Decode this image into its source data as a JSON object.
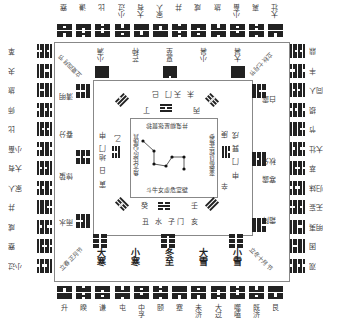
{
  "diagram": {
    "orientation": "rotated 180 degrees",
    "top_row_labels": [
      "蹇",
      "谦",
      "比",
      "小过",
      "大有",
      "家人",
      "井",
      "咸",
      "旅",
      "小畜",
      "离",
      "大壮"
    ],
    "bottom_row_labels": [
      "升",
      "睽",
      "谦",
      "屯",
      "中孚",
      "颐",
      "蹇",
      "未济",
      "大过",
      "噬嗑",
      "既济",
      "艮"
    ],
    "left_col_labels": [
      "革",
      "夬",
      "旅",
      "师",
      "比",
      "小畜",
      "大有",
      "家人",
      "井",
      "咸",
      "蹇",
      "小过"
    ],
    "right_col_labels": [
      "鼎",
      "丰",
      "同人",
      "损",
      "节",
      "大壮",
      "萃",
      "归妹",
      "无妄",
      "明夷",
      "困",
      "观"
    ],
    "solar_terms": {
      "bottom": [
        "大寒",
        "小寒",
        "冬至",
        "大雪",
        "小雪"
      ],
      "top": [
        "小满",
        "芒种",
        "夏至",
        "小暑",
        "大暑"
      ],
      "left": [
        "清明",
        "春分",
        "惊蛰",
        "雨水"
      ],
      "right": [
        "白露",
        "秋分",
        "寒露",
        "霜降"
      ]
    },
    "corner_diagonals": {
      "top_left": "立夏四月节",
      "top_right": "立秋七月节",
      "bottom_left": "立春正月节",
      "bottom_right": "立冬十月节"
    },
    "inner_ring": {
      "top": "未 天门 巳",
      "top_stem": [
        "丁",
        "丙"
      ],
      "bottom": "丑 水 子门 亥",
      "bottom_stem": [
        "癸",
        "壬"
      ],
      "left": "寅 日 地门 申",
      "left_stem": "乙",
      "right": "申 门 巽 戌",
      "right_stem": [
        "庚",
        "辛"
      ]
    },
    "center_box": {
      "top_text": "井鬼柳星张翼轸",
      "bottom_text": "斗牛女虚危室壁",
      "left_text": "角亢氐房心尾箕",
      "right_text": "奎娄胃昴毕觜参"
    }
  }
}
